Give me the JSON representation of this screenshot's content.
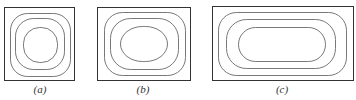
{
  "figure": {
    "background": "#ffffff",
    "stroke_color": "#555555",
    "frame_color": "#333333",
    "panels": [
      {
        "id": "a",
        "label": "(a)",
        "label_x": 40,
        "frame": {
          "x": 4,
          "y": 7,
          "w": 70,
          "h": 73
        },
        "contours": [
          {
            "x": 10,
            "y": 13,
            "w": 60,
            "h": 63,
            "rx": 17
          },
          {
            "x": 15,
            "y": 18,
            "w": 49,
            "h": 51,
            "rx": 18
          },
          {
            "x": 23,
            "y": 27,
            "w": 34,
            "h": 35,
            "rx": 16
          }
        ]
      },
      {
        "id": "b",
        "label": "(b)",
        "label_x": 143,
        "frame": {
          "x": 97,
          "y": 7,
          "w": 93,
          "h": 73
        },
        "contours": [
          {
            "x": 104,
            "y": 12,
            "w": 81,
            "h": 63,
            "rx": 18
          },
          {
            "x": 110,
            "y": 18,
            "w": 68,
            "h": 51,
            "rx": 20
          },
          {
            "x": 120,
            "y": 26,
            "w": 47,
            "h": 35,
            "rx": 22
          }
        ]
      },
      {
        "id": "c",
        "label": "(c)",
        "label_x": 282,
        "frame": {
          "x": 212,
          "y": 6,
          "w": 141,
          "h": 74
        },
        "contours": [
          {
            "x": 218,
            "y": 12,
            "w": 128,
            "h": 63,
            "rx": 18
          },
          {
            "x": 226,
            "y": 19,
            "w": 109,
            "h": 49,
            "rx": 20
          },
          {
            "x": 238,
            "y": 27,
            "w": 87,
            "h": 34,
            "rx": 17
          }
        ]
      }
    ]
  }
}
